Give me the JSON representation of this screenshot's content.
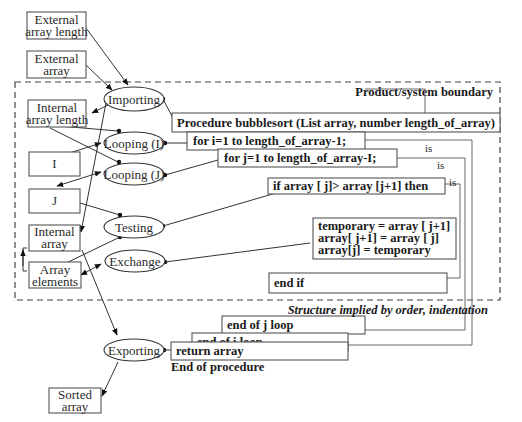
{
  "diagram": {
    "boundary_label": "Product/system boundary",
    "footer_caption": "Structure implied by order, indentation",
    "external_entities": {
      "external_array_length": [
        "External",
        "array length"
      ],
      "external_array": [
        "External",
        "array"
      ],
      "sorted_array": [
        "Sorted",
        "array"
      ]
    },
    "data_stores": {
      "internal_array_length": [
        "Internal",
        "array length"
      ],
      "i": "I",
      "j": "J",
      "internal_array": [
        "Internal",
        "array"
      ],
      "array_elements": [
        "Array",
        "elements"
      ]
    },
    "processes": {
      "importing": "Importing",
      "looping_i": "Looping (I)",
      "looping_j": "Looping (J)",
      "testing": "Testing",
      "exchange": "Exchange",
      "exporting": "Exporting"
    },
    "code": {
      "procedure": "Procedure bubblesort (List array, number length_of_array)",
      "for_i": "for i=1 to length_of_array-1;",
      "for_j": "for j=1 to length_of_array-I;",
      "if": "if array [ j]> array [j+1] then",
      "swap": [
        "temporary = array [ j+1]",
        "array[ j+1] = array [ j]",
        "array[j] = temporary"
      ],
      "end_if": "end if",
      "end_j": "end of j loop",
      "end_i": "end of i loop",
      "return": "return array",
      "end_procedure": "End of procedure"
    },
    "bracket_labels": [
      "is",
      "is",
      "is"
    ]
  }
}
